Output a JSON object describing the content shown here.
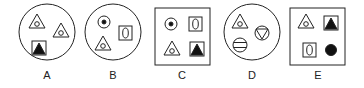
{
  "options": [
    {
      "label": "A",
      "frame": "circle",
      "items": [
        "triangle-with-circle",
        "triangle-with-circle",
        "square-with-filled-triangle"
      ]
    },
    {
      "label": "B",
      "frame": "circle",
      "items": [
        "circle-with-dot",
        "rectangle-with-oval",
        "triangle-with-circle"
      ]
    },
    {
      "label": "C",
      "frame": "square",
      "items": [
        "circle-with-dot",
        "rectangle-with-oval",
        "triangle-with-circle",
        "square-with-filled-triangle"
      ]
    },
    {
      "label": "D",
      "frame": "circle",
      "items": [
        "triangle-with-circle",
        "circle-with-inverted-triangle",
        "circle-with-horizontal-bars"
      ]
    },
    {
      "label": "E",
      "frame": "square",
      "items": [
        "triangle-with-circle",
        "square-with-filled-triangle",
        "rectangle-with-oval",
        "filled-circle"
      ]
    }
  ],
  "colors": {
    "stroke": "#222222",
    "fill": "#111111",
    "background": "#ffffff"
  }
}
